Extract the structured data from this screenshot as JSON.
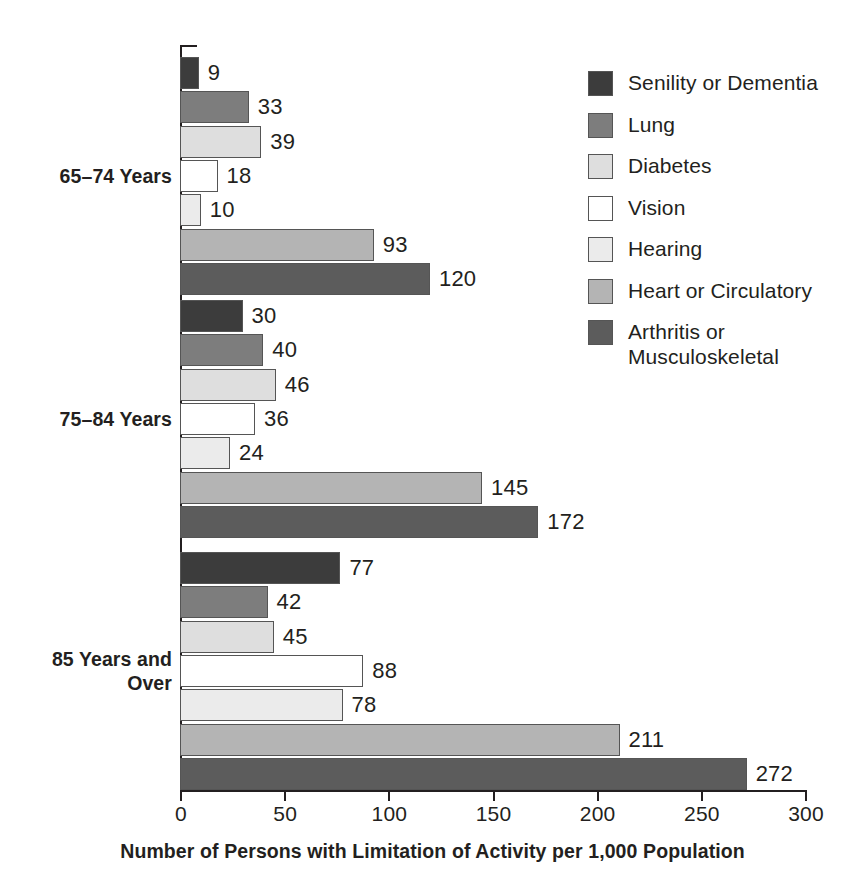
{
  "chart_data": {
    "type": "bar",
    "orientation": "horizontal",
    "title": "",
    "subtitle": "",
    "xlabel": "Number of Persons with Limitation of Activity per 1,000 Population",
    "ylabel": "",
    "xlim": [
      0,
      300
    ],
    "xticks": [
      0,
      50,
      100,
      150,
      200,
      250,
      300
    ],
    "xtick_labels": [
      "0",
      "50",
      "100",
      "150",
      "200",
      "250",
      "300"
    ],
    "grid": false,
    "legend_position": "right",
    "categories": [
      "65–74 Years",
      "75–84 Years",
      "85 Years and\nOver"
    ],
    "series": [
      {
        "name": "Senility or Dementia",
        "color": "#3c3c3c",
        "values": [
          9,
          30,
          77
        ]
      },
      {
        "name": "Lung",
        "color": "#7d7d7d",
        "values": [
          33,
          40,
          42
        ]
      },
      {
        "name": "Diabetes",
        "color": "#dedede",
        "values": [
          39,
          46,
          45
        ]
      },
      {
        "name": "Vision",
        "color": "#ffffff",
        "values": [
          18,
          36,
          88
        ]
      },
      {
        "name": "Hearing",
        "color": "#ebebeb",
        "values": [
          10,
          24,
          78
        ]
      },
      {
        "name": "Heart or Circulatory",
        "color": "#b4b4b4",
        "values": [
          93,
          145,
          211
        ]
      },
      {
        "name": "Arthritis or\nMusculoskeletal",
        "color": "#5c5c5c",
        "values": [
          120,
          172,
          272
        ]
      }
    ]
  },
  "legend": {
    "items": [
      {
        "label": "Senility or Dementia"
      },
      {
        "label": "Lung"
      },
      {
        "label": "Diabetes"
      },
      {
        "label": "Vision"
      },
      {
        "label": "Hearing"
      },
      {
        "label": "Heart or Circulatory"
      },
      {
        "label": "Arthritis or\nMusculoskeletal"
      }
    ]
  },
  "axis": {
    "x_title": "Number of Persons with Limitation of Activity per 1,000 Population"
  },
  "colors": {
    "text": "#231f20",
    "axis": "#231f20",
    "bar_outline": "#555555"
  }
}
